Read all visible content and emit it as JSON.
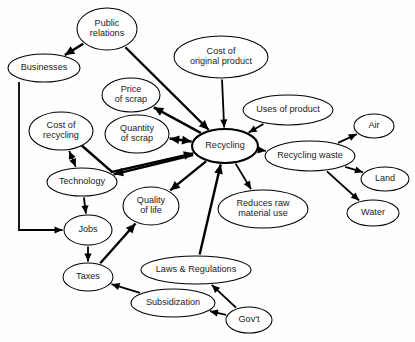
{
  "diagram": {
    "type": "concept-map",
    "background_color": "#fefefe",
    "node_fill": "#ffffff",
    "stroke_color": "#000000",
    "nodes": [
      {
        "id": "public_relations",
        "label": "Public\nrelations",
        "lines": [
          "Public",
          "relations"
        ],
        "cx": 107,
        "cy": 29,
        "rx": 30,
        "ry": 21,
        "emphasis": "normal"
      },
      {
        "id": "cost_original_product",
        "label": "Cost of\noriginal product",
        "lines": [
          "Cost of",
          "original product"
        ],
        "cx": 221,
        "cy": 57,
        "rx": 47,
        "ry": 21,
        "emphasis": "normal"
      },
      {
        "id": "businesses",
        "label": "Businesses",
        "lines": [
          "Businesses"
        ],
        "cx": 44,
        "cy": 68,
        "rx": 36,
        "ry": 14,
        "emphasis": "normal"
      },
      {
        "id": "price_of_scrap",
        "label": "Price\nof scrap",
        "lines": [
          "Price",
          "of scrap"
        ],
        "cx": 131,
        "cy": 95,
        "rx": 29,
        "ry": 17,
        "emphasis": "normal"
      },
      {
        "id": "uses_of_product",
        "label": "Uses of product",
        "lines": [
          "Uses of product"
        ],
        "cx": 288,
        "cy": 110,
        "rx": 45,
        "ry": 15,
        "emphasis": "normal"
      },
      {
        "id": "cost_of_recycling",
        "label": "Cost of\nrecycling",
        "lines": [
          "Cost of",
          "recycling"
        ],
        "cx": 61,
        "cy": 131,
        "rx": 32,
        "ry": 19,
        "emphasis": "normal"
      },
      {
        "id": "quantity_of_scrap",
        "label": "Quantity\nof scrap",
        "lines": [
          "Quantity",
          "of scrap"
        ],
        "cx": 137,
        "cy": 134,
        "rx": 32,
        "ry": 19,
        "emphasis": "normal"
      },
      {
        "id": "air",
        "label": "Air",
        "lines": [
          "Air"
        ],
        "cx": 374,
        "cy": 126,
        "rx": 20,
        "ry": 12,
        "emphasis": "normal"
      },
      {
        "id": "recycling",
        "label": "Recycling",
        "lines": [
          "Recycling"
        ],
        "cx": 225,
        "cy": 146,
        "rx": 33,
        "ry": 17,
        "emphasis": "hub"
      },
      {
        "id": "recycling_waste",
        "label": "Recycling waste",
        "lines": [
          "Recycling waste"
        ],
        "cx": 310,
        "cy": 156,
        "rx": 45,
        "ry": 15,
        "emphasis": "normal"
      },
      {
        "id": "technology",
        "label": "Technology",
        "lines": [
          "Technology"
        ],
        "cx": 82,
        "cy": 182,
        "rx": 35,
        "ry": 14,
        "emphasis": "normal"
      },
      {
        "id": "land",
        "label": "Land",
        "lines": [
          "Land"
        ],
        "cx": 385,
        "cy": 179,
        "rx": 24,
        "ry": 12,
        "emphasis": "normal"
      },
      {
        "id": "quality_of_life",
        "label": "Quality\nof life",
        "lines": [
          "Quality",
          "of life"
        ],
        "cx": 151,
        "cy": 206,
        "rx": 28,
        "ry": 19,
        "emphasis": "normal"
      },
      {
        "id": "reduces_raw_material",
        "label": "Reduces raw\nmaterial use",
        "lines": [
          "Reduces raw",
          "material use"
        ],
        "cx": 263,
        "cy": 209,
        "rx": 45,
        "ry": 19,
        "emphasis": "normal"
      },
      {
        "id": "jobs",
        "label": "Jobs",
        "lines": [
          "Jobs"
        ],
        "cx": 88,
        "cy": 230,
        "rx": 24,
        "ry": 15,
        "emphasis": "normal"
      },
      {
        "id": "water",
        "label": "Water",
        "lines": [
          "Water"
        ],
        "cx": 373,
        "cy": 213,
        "rx": 26,
        "ry": 13,
        "emphasis": "normal"
      },
      {
        "id": "laws_regulations",
        "label": "Laws & Regulations",
        "lines": [
          "Laws & Regulations"
        ],
        "cx": 196,
        "cy": 270,
        "rx": 55,
        "ry": 14,
        "emphasis": "normal"
      },
      {
        "id": "taxes",
        "label": "Taxes",
        "lines": [
          "Taxes"
        ],
        "cx": 88,
        "cy": 277,
        "rx": 25,
        "ry": 14,
        "emphasis": "normal"
      },
      {
        "id": "subsidization",
        "label": "Subsidization",
        "lines": [
          "Subsidization"
        ],
        "cx": 173,
        "cy": 303,
        "rx": 42,
        "ry": 14,
        "emphasis": "normal"
      },
      {
        "id": "govt",
        "label": "Gov't",
        "lines": [
          "Gov't"
        ],
        "cx": 249,
        "cy": 320,
        "rx": 23,
        "ry": 13,
        "emphasis": "normal"
      }
    ],
    "edges": [
      {
        "id": "pr-businesses",
        "from": "public_relations",
        "to": "businesses",
        "direction": "forward",
        "weight": "thick"
      },
      {
        "id": "pr-recycling",
        "from": "public_relations",
        "to": "recycling",
        "direction": "forward",
        "weight": "thick"
      },
      {
        "id": "cost-orig-recycling",
        "from": "cost_original_product",
        "to": "recycling",
        "direction": "forward",
        "weight": "medium"
      },
      {
        "id": "businesses-jobs",
        "from": "businesses",
        "to": "jobs",
        "direction": "forward",
        "weight": "medium"
      },
      {
        "id": "recycling-price",
        "from": "recycling",
        "to": "price_of_scrap",
        "direction": "forward",
        "weight": "thick"
      },
      {
        "id": "recycling-quantity",
        "from": "recycling",
        "to": "quantity_of_scrap",
        "direction": "both",
        "weight": "thick"
      },
      {
        "id": "cost-rec-recycling",
        "from": "cost_of_recycling",
        "to": "recycling",
        "direction": "forward",
        "weight": "thick"
      },
      {
        "id": "cost-rec-technology",
        "from": "cost_of_recycling",
        "to": "technology",
        "direction": "both",
        "weight": "medium"
      },
      {
        "id": "recycling-technology",
        "from": "recycling",
        "to": "technology",
        "direction": "forward",
        "weight": "thick"
      },
      {
        "id": "technology-jobs",
        "from": "technology",
        "to": "jobs",
        "direction": "forward",
        "weight": "medium"
      },
      {
        "id": "jobs-taxes",
        "from": "jobs",
        "to": "taxes",
        "direction": "forward",
        "weight": "medium"
      },
      {
        "id": "taxes-quality",
        "from": "taxes",
        "to": "quality_of_life",
        "direction": "forward",
        "weight": "thick"
      },
      {
        "id": "recycling-quality",
        "from": "recycling",
        "to": "quality_of_life",
        "direction": "forward",
        "weight": "thick"
      },
      {
        "id": "laws-recycling",
        "from": "laws_regulations",
        "to": "recycling",
        "direction": "forward",
        "weight": "thick"
      },
      {
        "id": "uses-recycling",
        "from": "uses_of_product",
        "to": "recycling",
        "direction": "forward",
        "weight": "medium"
      },
      {
        "id": "recycling-waste",
        "from": "recycling",
        "to": "recycling_waste",
        "direction": "forward",
        "weight": "medium"
      },
      {
        "id": "recycling-reduces",
        "from": "recycling",
        "to": "reduces_raw_material",
        "direction": "forward",
        "weight": "medium"
      },
      {
        "id": "waste-air",
        "from": "recycling_waste",
        "to": "air",
        "direction": "forward",
        "weight": "medium"
      },
      {
        "id": "waste-land",
        "from": "recycling_waste",
        "to": "land",
        "direction": "forward",
        "weight": "medium"
      },
      {
        "id": "waste-water",
        "from": "recycling_waste",
        "to": "water",
        "direction": "forward",
        "weight": "medium"
      },
      {
        "id": "subsid-taxes",
        "from": "subsidization",
        "to": "taxes",
        "direction": "forward",
        "weight": "medium"
      },
      {
        "id": "govt-laws",
        "from": "govt",
        "to": "laws_regulations",
        "direction": "forward",
        "weight": "medium"
      },
      {
        "id": "govt-subsid",
        "from": "govt",
        "to": "subsidization",
        "direction": "forward",
        "weight": "medium"
      }
    ],
    "polyline_edges": {
      "businesses-jobs": [
        [
          19,
          82
        ],
        [
          19,
          230
        ],
        [
          62,
          230
        ]
      ],
      "cost-rec-recycling": [
        [
          80,
          144
        ],
        [
          112,
          172
        ],
        [
          192,
          152
        ]
      ],
      "recycling-technology": [
        [
          193,
          155
        ],
        [
          120,
          180
        ]
      ]
    }
  }
}
